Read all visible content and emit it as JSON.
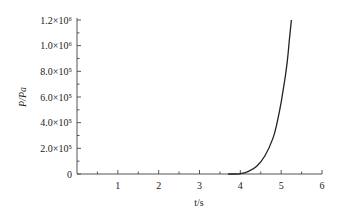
{
  "chart_data": {
    "type": "line",
    "title": "",
    "xlabel": "t/s",
    "ylabel": "P/Pa",
    "xlim": [
      0,
      6
    ],
    "ylim": [
      0,
      1200000
    ],
    "grid": false,
    "legend": null,
    "x_ticks": [
      "1",
      "2",
      "3",
      "4",
      "5",
      "6"
    ],
    "y_ticks": [
      "0",
      "2.0×10⁵",
      "4.0×10⁵",
      "6.0×10⁵",
      "8.0×10⁵",
      "1.0×10⁶",
      "1.2×10⁶"
    ],
    "series": [
      {
        "name": "P",
        "x": [
          3.7,
          3.9,
          4.0,
          4.2,
          4.4,
          4.6,
          4.8,
          4.9,
          5.0,
          5.1,
          5.15,
          5.2,
          5.25
        ],
        "y": [
          0,
          0,
          2000,
          20000,
          60000,
          140000,
          280000,
          400000,
          560000,
          760000,
          880000,
          1040000,
          1200000
        ]
      }
    ]
  }
}
